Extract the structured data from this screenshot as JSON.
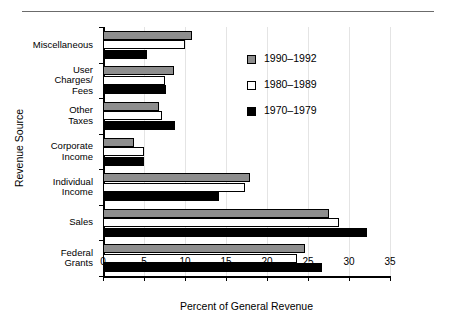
{
  "header": {
    "cut_off_text": "",
    "rule": "horizontal-rule"
  },
  "legend": {
    "position": "inside-upper-right",
    "entries": [
      {
        "label": "1990–1992",
        "swatch": "gray",
        "color": "#8e8e8e"
      },
      {
        "label": "1980–1989",
        "swatch": "white",
        "color": "#ffffff"
      },
      {
        "label": "1970–1979",
        "swatch": "black",
        "color": "#000000"
      }
    ]
  },
  "chart_data": {
    "type": "bar",
    "orientation": "horizontal",
    "title": "",
    "xlabel": "Percent of General Revenue",
    "ylabel": "Revenue Source",
    "xlim": [
      0,
      35
    ],
    "xticks": [
      0,
      5,
      10,
      15,
      20,
      25,
      30,
      35
    ],
    "xticklabels": [
      "0",
      "5",
      "10",
      "15",
      "20",
      "25",
      "30",
      "35"
    ],
    "grid": "vertical-light",
    "categories": [
      "Miscellaneous",
      "User Charges/ Fees",
      "Other Taxes",
      "Corporate Income",
      "Individual Income",
      "Sales",
      "Federal Grants"
    ],
    "category_lines": [
      [
        "Miscellaneous"
      ],
      [
        "User",
        "Charges/",
        "Fees"
      ],
      [
        "Other",
        "Taxes"
      ],
      [
        "Corporate",
        "Income"
      ],
      [
        "Individual",
        "Income"
      ],
      [
        "Sales"
      ],
      [
        "Federal",
        "Grants"
      ]
    ],
    "series": [
      {
        "name": "1990–1992",
        "color": "#8e8e8e",
        "values": [
          10.8,
          8.6,
          6.8,
          3.8,
          17.9,
          27.6,
          24.6
        ]
      },
      {
        "name": "1980–1989",
        "color": "#ffffff",
        "values": [
          10.0,
          7.6,
          7.2,
          5.0,
          17.3,
          28.8,
          23.6
        ]
      },
      {
        "name": "1970–1979",
        "color": "#000000",
        "values": [
          5.4,
          7.7,
          8.8,
          5.0,
          14.1,
          32.2,
          26.7
        ]
      }
    ]
  }
}
